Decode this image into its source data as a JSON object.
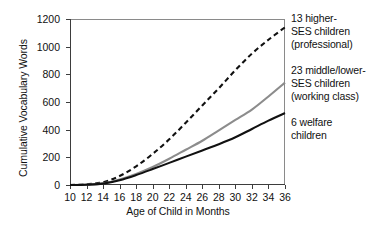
{
  "chart_data": {
    "type": "line",
    "title": "",
    "xlabel": "Age of Child in Months",
    "ylabel": "Cumulative Vocabulary Words",
    "xlim": [
      10,
      36
    ],
    "ylim": [
      0,
      1200
    ],
    "xticks": [
      10,
      12,
      14,
      16,
      18,
      20,
      22,
      24,
      26,
      28,
      30,
      32,
      34,
      36
    ],
    "yticks": [
      0,
      200,
      400,
      600,
      800,
      1000,
      1200
    ],
    "grid": false,
    "legend_position": "right-of-axes, aligned to series endpoints",
    "x": [
      10,
      12,
      14,
      16,
      18,
      20,
      22,
      24,
      26,
      28,
      30,
      32,
      34,
      36
    ],
    "series": [
      {
        "name": "13 higher-SES children (professional)",
        "style": "dashed",
        "color": "#111111",
        "values": [
          0,
          5,
          20,
          65,
          135,
          225,
          330,
          450,
          575,
          700,
          830,
          950,
          1050,
          1140
        ]
      },
      {
        "name": "23 middle/lower-SES children (working class)",
        "style": "solid",
        "color": "#8c8c8c",
        "values": [
          0,
          3,
          12,
          40,
          80,
          130,
          190,
          255,
          320,
          395,
          470,
          545,
          640,
          740
        ]
      },
      {
        "name": "6 welfare children",
        "style": "solid",
        "color": "#111111",
        "values": [
          0,
          2,
          10,
          35,
          72,
          115,
          160,
          205,
          250,
          295,
          345,
          405,
          465,
          520
        ]
      }
    ]
  },
  "axes": {
    "ylabel": "Cumulative Vocabulary Words",
    "xlabel": "Age of Child in Months",
    "ytick_labels": [
      "1200",
      "1000",
      "800",
      "600",
      "400",
      "200",
      "0"
    ],
    "xtick_labels": [
      "10",
      "12",
      "14",
      "16",
      "18",
      "20",
      "22",
      "24",
      "26",
      "28",
      "30",
      "32",
      "34",
      "36"
    ]
  },
  "legend": {
    "entries": [
      {
        "lines": [
          "13 higher-",
          "SES children",
          "(professional)"
        ],
        "series": "13 higher-SES children (professional)"
      },
      {
        "lines": [
          "23 middle/lower-",
          "SES children",
          "(working class)"
        ],
        "series": "23 middle/lower-SES children (working class)"
      },
      {
        "lines": [
          "6 welfare",
          "children"
        ],
        "series": "6 welfare children"
      }
    ]
  },
  "colors": {
    "series_professional": "#111111",
    "series_working_class": "#8c8c8c",
    "series_welfare": "#111111",
    "axis": "#3d3d3d",
    "background": "#ffffff"
  }
}
